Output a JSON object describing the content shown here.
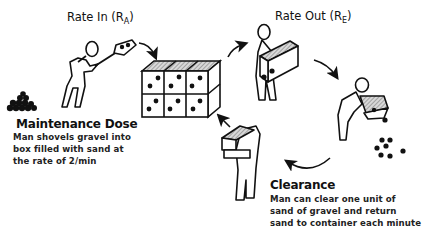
{
  "diagram": {
    "rate_in": {
      "label": "Rate In (",
      "subscript": "A",
      "close": ")",
      "symbol": "R"
    },
    "rate_out": {
      "label": "Rate Out (",
      "subscript": "E",
      "close": ")",
      "symbol": "R"
    },
    "maintenance": {
      "heading": "Maintenance Dose",
      "lines": [
        "Man shovels gravel into",
        "box filled with sand at",
        "the rate of 2/min"
      ]
    },
    "clearance": {
      "heading": "Clearance",
      "lines": [
        "Man can clear one unit of",
        "sand of gravel and return",
        "sand to container each minute"
      ]
    },
    "icons": [
      "man-shoveling-icon",
      "gravel-pile-icon",
      "container-box-icon",
      "man-carrying-box-icon",
      "man-emptying-box-icon",
      "scattered-gravel-icon",
      "man-returning-box-icon",
      "cycle-arrow-icon"
    ],
    "colors": {
      "ink": "#111111",
      "hatch": "#9a9a9a",
      "background": "#ffffff"
    }
  }
}
